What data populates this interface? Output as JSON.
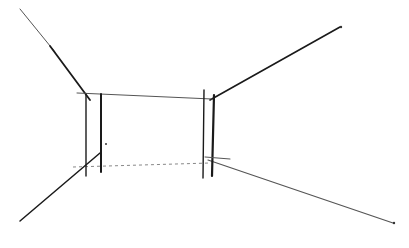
{
  "drawing": {
    "subject": "perspective room sketch",
    "colors": {
      "background": "#ffffff",
      "ink": "#1a1a1a",
      "faint_ink": "#555555"
    },
    "lines": {
      "upper_left_diagonal": [
        [
          20,
          9
        ],
        [
          90,
          100
        ]
      ],
      "upper_right_diagonal": [
        [
          215,
          97
        ],
        [
          340,
          27
        ]
      ],
      "lower_left_diagonal": [
        [
          20,
          221
        ],
        [
          100,
          154
        ]
      ],
      "lower_right_diagonal": [
        [
          210,
          160
        ],
        [
          393,
          223
        ]
      ],
      "top_horizontal": [
        [
          77,
          93
        ],
        [
          212,
          99
        ]
      ],
      "bottom_horizontal": [
        [
          73,
          166
        ],
        [
          210,
          163
        ]
      ],
      "left_vertical_1": [
        [
          86,
          94
        ],
        [
          86,
          176
        ]
      ],
      "left_vertical_2": [
        [
          101,
          94
        ],
        [
          101,
          172
        ]
      ],
      "right_vertical_1": [
        [
          204,
          90
        ],
        [
          203,
          178
        ]
      ],
      "right_vertical_2": [
        [
          213,
          95
        ],
        [
          212,
          176
        ]
      ],
      "right_bottom_tick": [
        [
          213,
          158
        ],
        [
          230,
          158
        ]
      ]
    }
  }
}
